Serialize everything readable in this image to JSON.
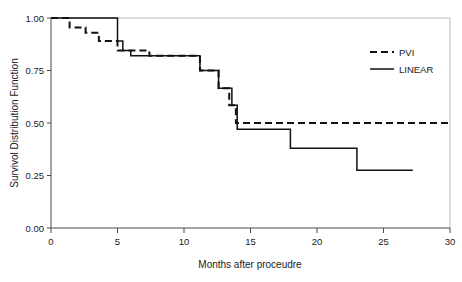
{
  "chart_data": {
    "type": "line",
    "subtype": "kaplan-meier-step",
    "title": "",
    "xlabel": "Months after proceudre",
    "ylabel": "Survivol Distribution Function",
    "xlim": [
      0,
      30
    ],
    "ylim": [
      0.0,
      1.0
    ],
    "xticks": [
      0,
      5,
      10,
      15,
      20,
      25,
      30
    ],
    "xtick_labels": [
      "0",
      "5",
      "10",
      "15",
      "20",
      "25",
      "30"
    ],
    "yticks": [
      0.0,
      0.25,
      0.5,
      0.75,
      1.0
    ],
    "ytick_labels": [
      "0.00",
      "0.25",
      "0.50",
      "0.75",
      "1.00"
    ],
    "grid": false,
    "legend_position": "top-right",
    "series": [
      {
        "name": "PVI",
        "style": "dashed",
        "color": "#111111",
        "steps": [
          {
            "x": 0.0,
            "y": 1.0
          },
          {
            "x": 1.4,
            "y": 1.0
          },
          {
            "x": 1.4,
            "y": 0.955
          },
          {
            "x": 2.6,
            "y": 0.955
          },
          {
            "x": 2.6,
            "y": 0.93
          },
          {
            "x": 3.6,
            "y": 0.93
          },
          {
            "x": 3.6,
            "y": 0.89
          },
          {
            "x": 5.0,
            "y": 0.89
          },
          {
            "x": 5.0,
            "y": 0.845
          },
          {
            "x": 7.4,
            "y": 0.845
          },
          {
            "x": 7.4,
            "y": 0.82
          },
          {
            "x": 11.2,
            "y": 0.82
          },
          {
            "x": 11.2,
            "y": 0.75
          },
          {
            "x": 12.6,
            "y": 0.75
          },
          {
            "x": 12.6,
            "y": 0.665
          },
          {
            "x": 13.4,
            "y": 0.665
          },
          {
            "x": 13.4,
            "y": 0.585
          },
          {
            "x": 13.9,
            "y": 0.585
          },
          {
            "x": 13.9,
            "y": 0.5
          },
          {
            "x": 30.0,
            "y": 0.5
          }
        ]
      },
      {
        "name": "LINEAR",
        "style": "solid",
        "color": "#111111",
        "steps": [
          {
            "x": 0.0,
            "y": 1.0
          },
          {
            "x": 5.0,
            "y": 1.0
          },
          {
            "x": 5.0,
            "y": 0.89
          },
          {
            "x": 5.4,
            "y": 0.89
          },
          {
            "x": 5.4,
            "y": 0.845
          },
          {
            "x": 6.0,
            "y": 0.845
          },
          {
            "x": 6.0,
            "y": 0.82
          },
          {
            "x": 11.2,
            "y": 0.82
          },
          {
            "x": 11.2,
            "y": 0.75
          },
          {
            "x": 12.6,
            "y": 0.75
          },
          {
            "x": 12.6,
            "y": 0.665
          },
          {
            "x": 13.6,
            "y": 0.665
          },
          {
            "x": 13.6,
            "y": 0.585
          },
          {
            "x": 14.0,
            "y": 0.585
          },
          {
            "x": 14.0,
            "y": 0.47
          },
          {
            "x": 18.0,
            "y": 0.47
          },
          {
            "x": 18.0,
            "y": 0.38
          },
          {
            "x": 23.0,
            "y": 0.38
          },
          {
            "x": 23.0,
            "y": 0.275
          },
          {
            "x": 27.2,
            "y": 0.275
          }
        ]
      }
    ],
    "legend": [
      {
        "label": "PVI",
        "style": "dashed"
      },
      {
        "label": "LINEAR",
        "style": "solid"
      }
    ]
  }
}
